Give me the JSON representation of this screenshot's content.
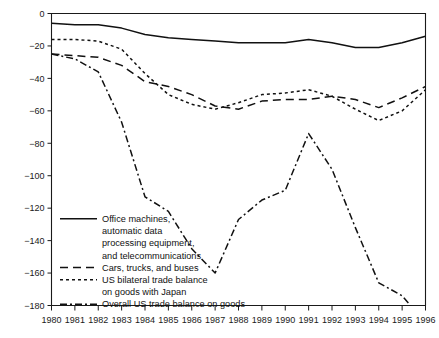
{
  "chart_data": {
    "type": "line",
    "title": "",
    "subtitle": "",
    "xlabel": "",
    "ylabel": "",
    "xlim": [
      1980,
      1996
    ],
    "ylim": [
      -180,
      0
    ],
    "grid": false,
    "legend_position": "inside-lower-left",
    "x": [
      1980,
      1981,
      1982,
      1983,
      1984,
      1985,
      1986,
      1987,
      1988,
      1989,
      1990,
      1991,
      1992,
      1993,
      1994,
      1995,
      1996
    ],
    "xtick_labels": [
      "1980",
      "1981",
      "1982",
      "1983",
      "1984",
      "1985",
      "1986",
      "1987",
      "1988",
      "1989",
      "1990",
      "1991",
      "1992",
      "1993",
      "1994",
      "1995",
      "1996"
    ],
    "ytick_labels": [
      "0",
      "-20",
      "-40",
      "-60",
      "-80",
      "-100",
      "-120",
      "-140",
      "-160",
      "-180"
    ],
    "ytick_values": [
      0,
      -20,
      -40,
      -60,
      -80,
      -100,
      -120,
      -140,
      -160,
      -180
    ],
    "series": [
      {
        "name": "Office machines, automatic data processing equipment, and telecommunications",
        "style": "solid",
        "values": [
          -6,
          -7,
          -7,
          -9,
          -13,
          -15,
          -16,
          -17,
          -18,
          -18,
          -18,
          -16,
          -18,
          -21,
          -21,
          -18,
          -14
        ]
      },
      {
        "name": "Cars, trucks, and buses",
        "style": "long-dash",
        "values": [
          -25,
          -26,
          -27,
          -32,
          -42,
          -45,
          -50,
          -57,
          -59,
          -54,
          -53,
          -53,
          -51,
          -53,
          -58,
          -52,
          -45
        ]
      },
      {
        "name": "US bilateral trade balance on goods with Japan",
        "style": "short-dash",
        "values": [
          -16,
          -16,
          -17,
          -22,
          -37,
          -50,
          -56,
          -59,
          -55,
          -50,
          -49,
          -47,
          -51,
          -59,
          -66,
          -60,
          -47
        ]
      },
      {
        "name": "Overall US trade balance on goods",
        "style": "dash-dot",
        "values": [
          -25,
          -28,
          -36,
          -67,
          -113,
          -122,
          -145,
          -160,
          -127,
          -115,
          -109,
          -74,
          -96,
          -132,
          -166,
          -174,
          -191
        ]
      }
    ]
  },
  "legend": {
    "entries": [
      {
        "style": "solid",
        "lines": [
          "Office machines,",
          "automatic data",
          "processing equipment,",
          "and telecommunications"
        ]
      },
      {
        "style": "long-dash",
        "lines": [
          "Cars, trucks, and buses"
        ]
      },
      {
        "style": "short-dash",
        "lines": [
          "US bilateral trade balance",
          "on goods with Japan"
        ]
      },
      {
        "style": "dash-dot",
        "lines": [
          "Overall US trade balance on goods"
        ]
      }
    ]
  },
  "colors": {
    "ink": "#111111",
    "background": "#ffffff"
  }
}
